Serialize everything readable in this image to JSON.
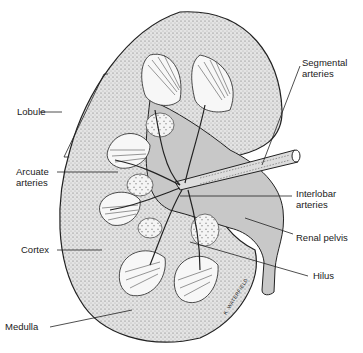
{
  "diagram": {
    "labels": {
      "lobule": "Lobule",
      "segmental_1": "Segmental",
      "segmental_2": "arteries",
      "arcuate_1": "Arcuate",
      "arcuate_2": "arteries",
      "interlobar_1": "Interlobar",
      "interlobar_2": "arteries",
      "renal_pelvis": "Renal pelvis",
      "cortex": "Cortex",
      "hilus": "Hilus",
      "medulla": "Medulla"
    },
    "signature": "K. WATERFIELD",
    "colors": {
      "cortex_fill": "#d9d9d9",
      "pelvis_fill": "#c8c8c8",
      "outline": "#222222",
      "medulla_fill": "#f2f2f2"
    }
  }
}
